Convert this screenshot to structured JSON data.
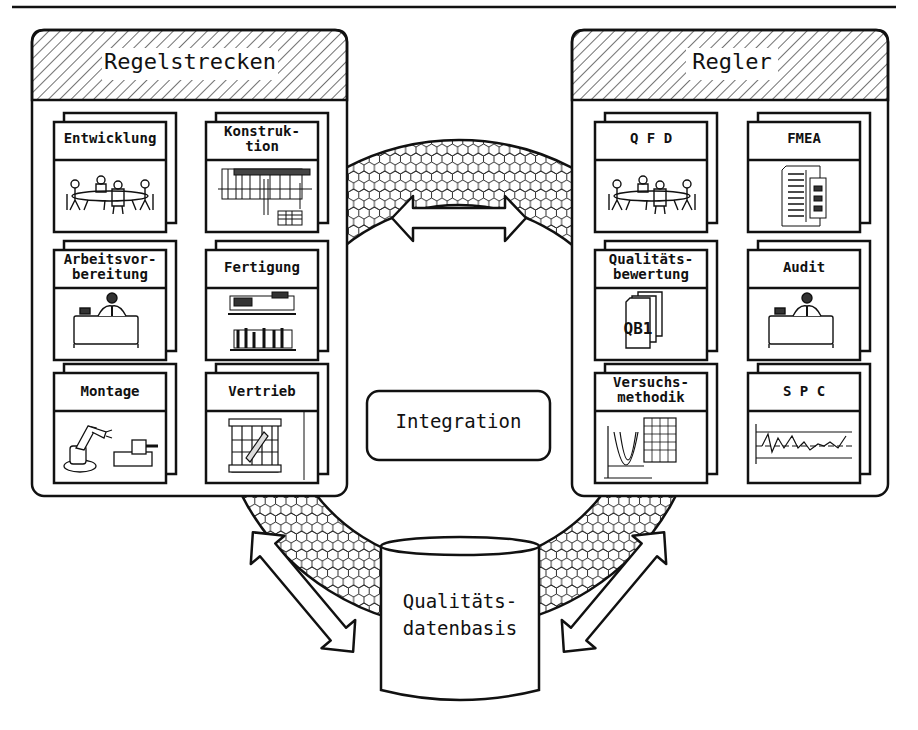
{
  "diagram": {
    "top_rule": true,
    "colors": {
      "stroke": "#111111",
      "background": "#ffffff",
      "fill": "#ffffff"
    }
  },
  "left_panel": {
    "title": "Regelstrecken",
    "cards": [
      {
        "label": "Entwicklung",
        "icon": "meeting-table-icon"
      },
      {
        "label": "Konstruk-\ntion",
        "icon": "technical-drawing-icon"
      },
      {
        "label": "Arbeitsvor-\nbereitung",
        "icon": "desk-worker-icon"
      },
      {
        "label": "Fertigung",
        "icon": "machine-tools-icon"
      },
      {
        "label": "Montage",
        "icon": "robot-arm-icon"
      },
      {
        "label": "Vertrieb",
        "icon": "crate-icon"
      }
    ]
  },
  "right_panel": {
    "title": "Regler",
    "cards": [
      {
        "label": "Q F D",
        "icon": "meeting-table-icon"
      },
      {
        "label": "FMEA",
        "icon": "document-form-icon"
      },
      {
        "label": "Qualitäts-\nbewertung",
        "icon": "document-stack-icon",
        "icon_text": "QB1"
      },
      {
        "label": "Audit",
        "icon": "desk-worker-icon"
      },
      {
        "label": "Versuchs-\nmethodik",
        "icon": "parabola-table-icon"
      },
      {
        "label": "S P C",
        "icon": "control-chart-icon"
      }
    ]
  },
  "center": {
    "integration_label": "Integration",
    "database_label": "Qualitäts-\ndatenbasis"
  },
  "arrows": [
    {
      "name": "top-arrow",
      "direction": "bidirectional-horizontal"
    },
    {
      "name": "left-arrow",
      "direction": "bidirectional-diagonal"
    },
    {
      "name": "right-arrow",
      "direction": "bidirectional-diagonal"
    }
  ]
}
